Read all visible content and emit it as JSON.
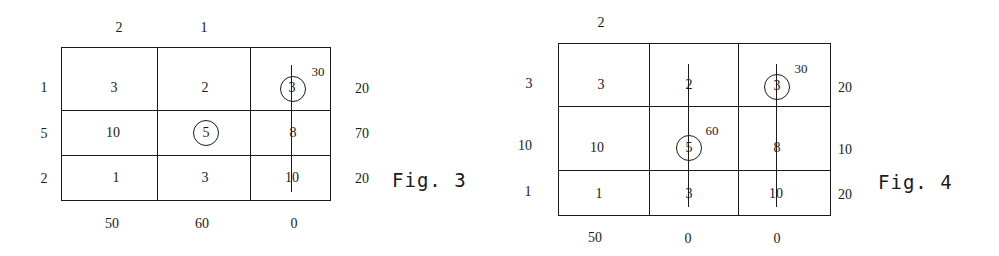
{
  "figures": [
    {
      "caption": "Fig. 3",
      "column_potentials": [
        "2",
        "1",
        ""
      ],
      "row_potentials": [
        "1",
        "5",
        "2"
      ],
      "costs": [
        [
          "3",
          "2",
          "3"
        ],
        [
          "10",
          "5",
          "8"
        ],
        [
          "1",
          "3",
          "10"
        ]
      ],
      "circled_cells": [
        [
          0,
          2
        ],
        [
          1,
          1
        ]
      ],
      "allocations": [
        {
          "row": 0,
          "col": 2,
          "value": "30"
        }
      ],
      "row_labels_right": [
        "20",
        "70",
        "20"
      ],
      "column_labels_bottom": [
        "50",
        "60",
        "0"
      ]
    },
    {
      "caption": "Fig. 4",
      "column_potentials": [
        "2",
        "",
        ""
      ],
      "row_potentials": [
        "3",
        "10",
        "1"
      ],
      "costs": [
        [
          "3",
          "2",
          "3"
        ],
        [
          "10",
          "5",
          "8"
        ],
        [
          "1",
          "3",
          "10"
        ]
      ],
      "circled_cells": [
        [
          0,
          2
        ],
        [
          1,
          1
        ]
      ],
      "allocations": [
        {
          "row": 0,
          "col": 2,
          "value": "30"
        },
        {
          "row": 1,
          "col": 1,
          "value": "60"
        }
      ],
      "row_labels_right": [
        "20",
        "10",
        "20"
      ],
      "column_labels_bottom": [
        "50",
        "0",
        "0"
      ]
    }
  ]
}
